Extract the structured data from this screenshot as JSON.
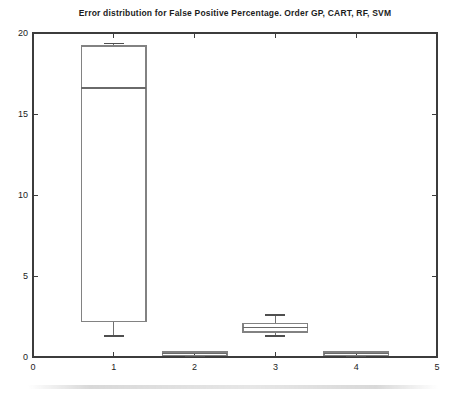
{
  "chart_data": {
    "type": "boxplot",
    "title": "Error distribution for False Positive Percentage. Order GP, CART, RF, SVM",
    "categories": [
      "GP",
      "CART",
      "RF",
      "SVM"
    ],
    "series": [
      {
        "name": "GP",
        "x": 1,
        "whisker_low": 1.3,
        "q1": 2.2,
        "median": 16.6,
        "q3": 19.2,
        "whisker_high": 19.35
      },
      {
        "name": "CART",
        "x": 2,
        "whisker_low": 0.05,
        "q1": 0.1,
        "median": 0.2,
        "q3": 0.3,
        "whisker_high": 0.35
      },
      {
        "name": "RF",
        "x": 3,
        "whisker_low": 1.3,
        "q1": 1.55,
        "median": 1.8,
        "q3": 2.05,
        "whisker_high": 2.6
      },
      {
        "name": "SVM",
        "x": 4,
        "whisker_low": 0.05,
        "q1": 0.1,
        "median": 0.2,
        "q3": 0.3,
        "whisker_high": 0.35
      }
    ],
    "xlim": [
      0,
      5
    ],
    "ylim": [
      0,
      20
    ],
    "x_ticks": [
      0,
      1,
      2,
      3,
      4,
      5
    ],
    "y_ticks": [
      0,
      5,
      10,
      15,
      20
    ],
    "xlabel": "",
    "ylabel": "",
    "grid": false,
    "legend": null,
    "box_half_width": 0.4
  },
  "colors": {
    "background": "#ffffff",
    "axis": "#3c3c3c",
    "tick_text": "#1c1c1c",
    "box_stroke": "#828282",
    "median_stroke": "#6a6a6a",
    "whisker_stroke": "#707070",
    "cap_stroke": "#4f4f4f"
  }
}
